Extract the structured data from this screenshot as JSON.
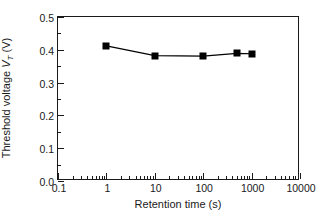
{
  "chart_data": {
    "type": "line",
    "title": "",
    "xlabel": "Retention time (s)",
    "ylabel": "Threshold voltage V_T (V)",
    "ylabel_parts": {
      "pre": "Threshold voltage ",
      "symbol": "V",
      "subscript": "T",
      "post": " (V)"
    },
    "xscale": "log",
    "yscale": "linear",
    "xlim": [
      0.1,
      10000
    ],
    "ylim": [
      0.0,
      0.5
    ],
    "grid": false,
    "legend": "none",
    "marker": "filled-square",
    "line_color": "#000000",
    "marker_color": "#000000",
    "x": [
      1,
      10,
      100,
      500,
      1000
    ],
    "y": [
      0.412,
      0.382,
      0.381,
      0.389,
      0.388
    ],
    "series": [
      {
        "name": "Threshold voltage",
        "x": [
          1,
          10,
          100,
          500,
          1000
        ],
        "values": [
          0.412,
          0.382,
          0.381,
          0.389,
          0.388
        ]
      }
    ],
    "xticks": [
      0.1,
      1,
      10,
      100,
      1000,
      10000
    ],
    "xticklabels": [
      "0.1",
      "1",
      "10",
      "100",
      "1000",
      "10000"
    ],
    "yticks": [
      0.0,
      0.1,
      0.2,
      0.3,
      0.4,
      0.5
    ],
    "yticklabels": [
      "0.0",
      "0.1",
      "0.2",
      "0.3",
      "0.4",
      "0.5"
    ]
  }
}
